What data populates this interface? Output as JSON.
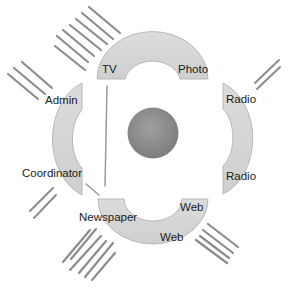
{
  "diagram": {
    "center": {
      "shape": "circle",
      "color": "#8a8a8a"
    },
    "colors": {
      "arc_fill": "#d4d4d4",
      "arc_stroke": "#b8b8b8",
      "hatch": "#8c8c8c",
      "connector": "#9a9a9a"
    },
    "segments": [
      {
        "id": "top",
        "labels": [
          "TV",
          "Photo"
        ]
      },
      {
        "id": "right",
        "labels": [
          "Radio",
          "Radio"
        ]
      },
      {
        "id": "bottom",
        "labels": [
          "Web",
          "Web"
        ]
      },
      {
        "id": "left",
        "labels": [
          "Admin",
          "Coordinator"
        ]
      }
    ],
    "external_labels": [
      "Newspaper"
    ]
  },
  "labels": {
    "tv": "TV",
    "photo": "Photo",
    "radio_top": "Radio",
    "radio_bottom": "Radio",
    "admin": "Admin",
    "coordinator": "Coordinator",
    "newspaper": "Newspaper",
    "web_top": "Web",
    "web_bottom": "Web"
  }
}
